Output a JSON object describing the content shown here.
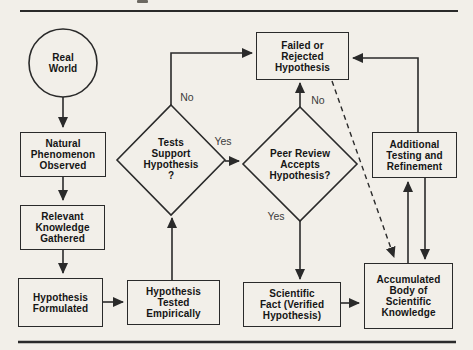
{
  "figure": {
    "background_color": "#f2efe9",
    "line_color": "#2a2a2a",
    "text_color": "#151515"
  },
  "nodes": {
    "real_world": {
      "shape": "circle",
      "lines": [
        "Real",
        "World"
      ]
    },
    "natural_phenomenon": {
      "shape": "rect",
      "lines": [
        "Natural",
        "Phenomenon",
        "Observed"
      ]
    },
    "relevant_knowledge": {
      "shape": "rect",
      "lines": [
        "Relevant",
        "Knowledge",
        "Gathered"
      ]
    },
    "hypothesis_formulated": {
      "shape": "rect",
      "lines": [
        "Hypothesis",
        "Formulated"
      ]
    },
    "hypothesis_tested": {
      "shape": "rect",
      "lines": [
        "Hypothesis",
        "Tested",
        "Empirically"
      ]
    },
    "tests_support": {
      "shape": "diamond",
      "lines": [
        "Tests",
        "Support",
        "Hypothesis",
        "?"
      ]
    },
    "peer_review": {
      "shape": "diamond",
      "lines": [
        "Peer Review",
        "Accepts",
        "Hypothesis?"
      ]
    },
    "failed_rejected": {
      "shape": "rect",
      "lines": [
        "Failed or",
        "Rejected",
        "Hypothesis"
      ]
    },
    "additional_testing": {
      "shape": "rect",
      "lines": [
        "Additional",
        "Testing and",
        "Refinement"
      ]
    },
    "scientific_fact": {
      "shape": "rect",
      "lines": [
        "Scientific",
        "Fact (Verified",
        "Hypothesis)"
      ]
    },
    "accumulated_body": {
      "shape": "rect",
      "lines": [
        "Accumulated",
        "Body of",
        "Scientific",
        "Knowledge"
      ]
    }
  },
  "edge_labels": {
    "tests_no": "No",
    "tests_yes": "Yes",
    "peer_no": "No",
    "peer_yes": "Yes"
  }
}
